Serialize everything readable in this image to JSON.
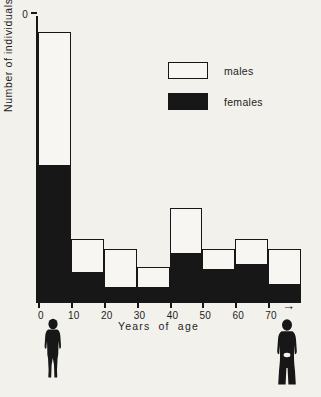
{
  "chart_data": {
    "type": "bar",
    "subtype": "stacked-histogram",
    "title": "",
    "xlabel": "Years of age",
    "ylabel": "Number of individuals",
    "categories": [
      "0-10",
      "10-20",
      "20-30",
      "30-40",
      "40-50",
      "50-60",
      "60-70",
      "70+"
    ],
    "bin_starts": [
      0,
      10,
      20,
      30,
      40,
      50,
      60,
      70
    ],
    "bin_width": 10,
    "series": [
      {
        "name": "females",
        "color": "#171717",
        "fill": "solid-black",
        "values": [
          26,
          5.5,
          2.5,
          2.5,
          9,
          6,
          7,
          3
        ]
      },
      {
        "name": "males",
        "color": "#f7f6f2",
        "fill": "stipple",
        "values": [
          26,
          6.5,
          7.5,
          4,
          9,
          4,
          5,
          7
        ]
      }
    ],
    "totals": [
      52,
      12,
      10,
      6.5,
      18,
      10,
      12,
      10
    ],
    "xlim": [
      0,
      80
    ],
    "ylim": [
      0,
      55
    ],
    "xticks": [
      0,
      10,
      20,
      30,
      40,
      50,
      60,
      70
    ],
    "xticklabels": [
      "0",
      "10",
      "20",
      "30",
      "40",
      "50",
      "60",
      "70"
    ],
    "yticks": [
      0,
      10,
      20,
      30,
      40,
      50
    ],
    "yticklabels": [
      "0",
      "10",
      "20",
      "30",
      "40",
      "50"
    ],
    "grid": false,
    "legend_position": "upper-right-inside",
    "axis_arrow": "→",
    "annotations": [
      "child silhouette below left of axis",
      "adult silhouette below right of axis"
    ]
  },
  "axes": {
    "y_title": "Number  of  individuals",
    "x_title": "Years   of   age",
    "arrow_glyph": "→"
  },
  "legend": {
    "items": [
      {
        "label": "males",
        "swatch": "stipple"
      },
      {
        "label": "females",
        "swatch": "solid-black"
      }
    ]
  },
  "figures": {
    "left": "child-silhouette",
    "right": "adult-silhouette"
  }
}
